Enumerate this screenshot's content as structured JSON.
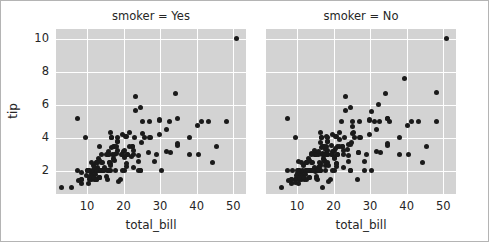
{
  "figure": {
    "background_color": "#ffffff",
    "border_color": "#b4b4b4",
    "axes_background_color": "#d3d3d3",
    "grid_color": "#ffffff",
    "marker_color": "#1a1a1a",
    "text_color": "#262626"
  },
  "axis_labels": {
    "x": "total_bill",
    "y": "tip"
  },
  "ticks": {
    "x": [
      "10",
      "20",
      "30",
      "40",
      "50"
    ],
    "y": [
      "2",
      "4",
      "6",
      "8",
      "10"
    ]
  },
  "facets": [
    {
      "title": "smoker = Yes"
    },
    {
      "title": "smoker = No"
    }
  ],
  "chart_data": {
    "type": "scatter",
    "title": "",
    "xlabel": "total_bill",
    "ylabel": "tip",
    "xlim": [
      1.5,
      53.5
    ],
    "ylim": [
      0.6,
      10.6
    ],
    "xticks": [
      10,
      20,
      30,
      40,
      50
    ],
    "yticks": [
      2,
      4,
      6,
      8,
      10
    ],
    "grid": true,
    "legend": "none",
    "facet_variable": "smoker",
    "marker": "circle",
    "marker_size": 5,
    "series": [
      {
        "name": "smoker = Yes",
        "facet_title": "smoker = Yes",
        "x": [
          38.01,
          11.24,
          20.29,
          13.81,
          11.02,
          18.29,
          17.59,
          20.08,
          16.45,
          3.07,
          20.23,
          15.01,
          12.02,
          17.07,
          26.86,
          25.28,
          14.73,
          10.51,
          17.92,
          27.2,
          22.76,
          17.29,
          19.44,
          16.66,
          32.68,
          15.98,
          34.83,
          13.03,
          18.28,
          24.71,
          21.16,
          28.97,
          22.49,
          5.75,
          16.32,
          22.75,
          40.17,
          27.28,
          12.03,
          21.01,
          12.46,
          11.35,
          15.38,
          44.3,
          22.42,
          20.92,
          15.36,
          20.49,
          25.21,
          18.24,
          14.0,
          38.07,
          23.95,
          25.71,
          17.31,
          29.93,
          10.65,
          12.43,
          24.08,
          11.69,
          13.42,
          14.26,
          15.95,
          12.48,
          29.8,
          8.52,
          14.52,
          11.38,
          22.82,
          19.08,
          20.27,
          11.17,
          12.26,
          18.26,
          8.51,
          10.33,
          14.15,
          16.0,
          13.16,
          17.47,
          34.3,
          41.19,
          27.05,
          16.43,
          8.35,
          18.64,
          11.87,
          9.78,
          7.51,
          14.07,
          13.13,
          17.26,
          24.55,
          19.77,
          29.85,
          48.17,
          25.0,
          13.39,
          16.49,
          21.5,
          12.66,
          16.21,
          13.81,
          17.51,
          24.52,
          20.76,
          31.71,
          10.59,
          10.63,
          50.81,
          15.81,
          7.25,
          31.85,
          16.82,
          32.9,
          17.89,
          14.48,
          9.6,
          34.63,
          34.65,
          23.33,
          45.35,
          23.17,
          40.55,
          20.69,
          30.46,
          18.15,
          23.1,
          15.69,
          19.81,
          28.44,
          15.48,
          16.58,
          7.56,
          10.34,
          43.11,
          13.0,
          12.74,
          13.42,
          16.27,
          10.09,
          12.76,
          13.37,
          12.69,
          21.7,
          19.65,
          12.76,
          22.12,
          24.01,
          12.46,
          12.16,
          13.42,
          8.58,
          15.98,
          13.42,
          16.27,
          10.09
        ],
        "y": [
          3.0,
          1.76,
          3.21,
          2.0,
          1.98,
          3.76,
          2.64,
          3.15,
          2.47,
          1.0,
          2.01,
          2.09,
          1.97,
          3.0,
          3.14,
          5.0,
          2.2,
          1.25,
          3.08,
          4.0,
          3.0,
          2.71,
          3.0,
          3.4,
          5.0,
          3.0,
          5.17,
          2.0,
          4.0,
          5.85,
          3.0,
          3.0,
          3.5,
          1.0,
          4.3,
          3.25,
          4.73,
          4.0,
          1.5,
          3.0,
          1.5,
          2.5,
          3.0,
          2.5,
          3.48,
          4.08,
          1.64,
          4.06,
          4.29,
          3.76,
          3.0,
          4.0,
          2.55,
          4.0,
          3.5,
          5.07,
          1.5,
          1.8,
          2.92,
          2.31,
          1.58,
          2.5,
          2.0,
          2.52,
          4.2,
          1.48,
          2.0,
          2.0,
          2.18,
          1.5,
          2.83,
          1.5,
          2.0,
          3.25,
          1.25,
          2.0,
          2.0,
          2.0,
          2.75,
          3.5,
          6.7,
          5.0,
          5.0,
          2.3,
          1.5,
          1.36,
          1.63,
          1.73,
          2.0,
          2.5,
          2.0,
          2.74,
          2.0,
          2.0,
          5.14,
          5.0,
          3.75,
          2.61,
          2.0,
          3.5,
          2.5,
          2.0,
          2.0,
          3.0,
          2.0,
          2.24,
          4.5,
          1.61,
          2.0,
          10.0,
          3.16,
          5.15,
          3.18,
          4.0,
          3.11,
          2.0,
          2.0,
          4.0,
          3.55,
          3.68,
          5.65,
          3.5,
          6.5,
          3.0,
          2.45,
          2.0,
          3.5,
          4.0,
          1.5,
          4.19,
          2.56,
          2.02,
          4.0,
          1.44,
          2.0,
          5.0,
          2.0,
          2.01,
          1.58,
          2.5,
          2.0,
          2.23,
          2.0,
          2.0,
          4.3,
          3.0,
          2.5,
          2.88,
          2.0,
          1.5,
          2.2,
          1.58,
          1.92,
          3.0,
          3.48,
          2.5,
          2.0
        ]
      },
      {
        "name": "smoker = No",
        "facet_title": "smoker = No",
        "x": [
          16.99,
          10.34,
          21.01,
          23.68,
          24.59,
          25.29,
          8.77,
          26.88,
          15.04,
          14.78,
          10.27,
          35.26,
          15.42,
          18.43,
          14.83,
          21.58,
          10.33,
          16.29,
          16.97,
          20.65,
          17.92,
          20.29,
          15.77,
          39.42,
          19.82,
          17.81,
          13.37,
          12.69,
          21.7,
          19.65,
          9.55,
          18.35,
          15.06,
          20.69,
          17.78,
          24.06,
          16.31,
          16.93,
          18.69,
          31.27,
          16.04,
          17.46,
          13.94,
          9.68,
          30.4,
          18.29,
          22.23,
          32.4,
          28.55,
          18.04,
          12.54,
          10.29,
          34.81,
          9.94,
          25.56,
          19.49,
          38.01,
          26.41,
          11.24,
          48.27,
          20.29,
          13.81,
          11.02,
          18.29,
          17.59,
          20.08,
          16.45,
          20.23,
          15.01,
          12.02,
          17.07,
          26.86,
          25.28,
          14.73,
          10.51,
          17.92,
          27.2,
          22.76,
          17.29,
          19.44,
          16.66,
          10.07,
          32.68,
          15.98,
          34.83,
          13.03,
          18.28,
          24.71,
          21.16,
          28.97,
          22.49,
          5.75,
          16.32,
          22.75,
          40.17,
          27.28,
          12.03,
          21.01,
          12.46,
          11.35,
          15.38,
          44.3,
          22.42,
          20.92,
          15.36,
          20.49,
          25.21,
          18.24,
          14.0,
          38.07,
          23.95,
          25.71,
          17.31,
          29.93,
          10.65,
          12.43,
          24.08,
          11.69,
          13.42,
          14.26,
          15.95,
          12.48,
          29.8,
          8.52,
          14.52,
          11.38,
          22.82,
          19.08,
          20.27,
          11.17,
          12.26,
          18.26,
          8.51,
          10.33,
          14.15,
          16.0,
          13.16,
          17.47,
          34.3,
          41.19,
          27.05,
          16.43,
          8.35,
          18.64,
          11.87,
          9.78,
          7.51,
          14.07,
          13.13,
          17.26,
          24.55,
          19.77,
          29.85,
          48.17,
          25.0,
          13.39,
          16.49,
          21.5,
          12.66,
          16.21,
          13.81,
          17.51,
          24.52,
          20.76,
          31.71,
          10.59,
          10.63,
          50.81,
          15.81,
          7.25,
          31.85,
          16.82,
          32.9,
          17.89,
          14.48,
          9.6,
          34.63,
          34.65,
          23.33,
          45.35,
          23.17,
          40.55,
          20.69,
          30.46,
          18.15,
          23.1,
          15.69,
          19.81,
          28.44,
          15.48,
          16.58,
          7.56,
          10.34,
          43.11,
          13.0,
          12.74,
          13.42,
          16.27,
          10.09
        ],
        "y": [
          1.01,
          1.66,
          3.5,
          3.31,
          3.61,
          4.71,
          2.0,
          3.12,
          1.96,
          3.23,
          1.71,
          5.0,
          1.57,
          3.0,
          3.02,
          3.92,
          1.67,
          3.71,
          3.5,
          3.35,
          4.08,
          2.75,
          2.23,
          7.58,
          3.18,
          2.34,
          2.0,
          2.0,
          4.3,
          3.0,
          1.45,
          2.5,
          3.0,
          2.45,
          3.27,
          3.6,
          2.0,
          3.07,
          2.31,
          5.0,
          2.24,
          2.54,
          3.06,
          1.32,
          5.6,
          3.0,
          5.0,
          6.0,
          2.05,
          3.0,
          2.5,
          2.6,
          5.2,
          1.56,
          4.34,
          3.51,
          3.0,
          1.5,
          1.76,
          6.73,
          3.21,
          2.0,
          1.98,
          3.76,
          2.64,
          3.15,
          2.47,
          2.01,
          2.09,
          1.97,
          3.0,
          3.14,
          5.0,
          2.2,
          1.25,
          3.08,
          4.0,
          3.0,
          2.71,
          3.0,
          3.4,
          1.83,
          5.0,
          3.0,
          5.17,
          2.0,
          4.0,
          5.85,
          3.0,
          3.0,
          3.5,
          1.0,
          4.3,
          3.25,
          4.73,
          4.0,
          1.5,
          3.0,
          1.5,
          2.5,
          3.0,
          2.5,
          3.48,
          4.08,
          1.64,
          4.06,
          4.29,
          3.76,
          3.0,
          4.0,
          2.55,
          4.0,
          3.5,
          5.07,
          1.5,
          1.8,
          2.92,
          2.31,
          1.58,
          2.5,
          2.0,
          2.52,
          4.2,
          1.48,
          2.0,
          2.0,
          2.18,
          1.5,
          2.83,
          1.5,
          2.0,
          3.25,
          1.25,
          2.0,
          2.0,
          2.0,
          2.75,
          3.5,
          6.7,
          5.0,
          5.0,
          2.3,
          1.5,
          1.36,
          1.63,
          1.73,
          2.0,
          2.5,
          2.0,
          2.74,
          2.0,
          2.0,
          5.14,
          5.0,
          3.75,
          2.61,
          2.0,
          3.5,
          2.5,
          2.0,
          2.0,
          3.0,
          2.0,
          2.24,
          4.5,
          1.61,
          2.0,
          10.0,
          3.16,
          5.15,
          3.18,
          4.0,
          3.11,
          2.0,
          2.0,
          4.0,
          3.55,
          3.68,
          5.65,
          3.5,
          6.5,
          3.0,
          2.45,
          2.0,
          3.5,
          4.0,
          1.5,
          4.19,
          2.56,
          2.02,
          4.0,
          1.44,
          2.0,
          5.0,
          2.0,
          2.01,
          1.58,
          2.5,
          2.0
        ]
      }
    ]
  }
}
